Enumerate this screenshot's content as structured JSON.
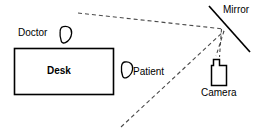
{
  "diagram": {
    "type": "schematic-floor-plan",
    "colors": {
      "stroke": "#000000",
      "background": "#ffffff",
      "dashed_stroke": "#555555"
    },
    "labels": {
      "doctor": "Doctor",
      "desk": "Desk",
      "patient": "Patient",
      "mirror": "Mirror",
      "camera": "Camera"
    },
    "elements": [
      {
        "name": "desk",
        "shape": "rectangle",
        "label": "Desk",
        "filled": false
      },
      {
        "name": "doctor",
        "shape": "teardrop-head",
        "label": "Doctor"
      },
      {
        "name": "patient",
        "shape": "teardrop-head",
        "label": "Patient"
      },
      {
        "name": "mirror",
        "shape": "diagonal-line",
        "label": "Mirror"
      },
      {
        "name": "camera",
        "shape": "body-with-lens",
        "label": "Camera"
      }
    ],
    "sight_lines": [
      {
        "name": "doctor-to-mirror",
        "style": "dashed"
      },
      {
        "name": "patient-to-mirror",
        "style": "dashed"
      },
      {
        "name": "mirror-to-camera",
        "style": "dashed"
      }
    ]
  }
}
